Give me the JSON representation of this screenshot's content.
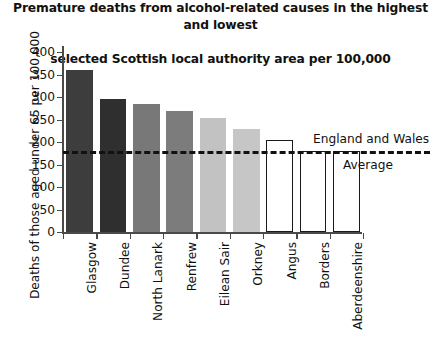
{
  "chart_data": {
    "type": "bar",
    "title": "Premature deaths from alcohol-related causes in the highest and lowest\nselected Scottish local authority area per 100,000",
    "title_line1": "Premature deaths from alcohol-related causes in the highest and lowest",
    "title_line2": "selected Scottish local authority area per 100,000",
    "xlabel": "",
    "ylabel": "Deaths of those aged under 65 per 100,000",
    "ylim": [
      0,
      400
    ],
    "ytick_values": [
      0,
      50,
      100,
      150,
      200,
      250,
      300,
      350,
      400
    ],
    "ytick_labels": [
      "0",
      "50",
      "100",
      "150",
      "200",
      "250",
      "300",
      "350",
      "400"
    ],
    "grid": false,
    "legend": null,
    "categories": [
      "Glasgow",
      "Dundee",
      "North Lanark",
      "Renfrew",
      "Eilean Sair",
      "Orkney",
      "Angus",
      "Borders",
      "Aberdeenshire"
    ],
    "values": [
      360,
      295,
      285,
      270,
      253,
      228,
      205,
      180,
      180
    ],
    "bar_colors": [
      "#3d3d3d",
      "#2f2f2f",
      "#787878",
      "#7c7c7c",
      "#c2c2c2",
      "#c6c6c6",
      "#ffffff",
      "#ffffff",
      "#ffffff"
    ],
    "bar_outlined": [
      false,
      false,
      false,
      false,
      false,
      false,
      true,
      true,
      true
    ],
    "annotations": [
      {
        "name": "england-and-wales-average",
        "type": "hline",
        "value": 180,
        "label_top": "England and Wales",
        "label_bottom": "Average",
        "style": "dashed",
        "color": "#111111"
      }
    ]
  }
}
